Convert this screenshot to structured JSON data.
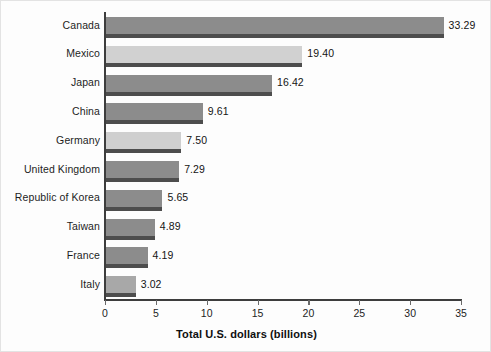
{
  "chart_data": {
    "type": "bar",
    "orientation": "horizontal",
    "title": "",
    "xlabel": "Total U.S. dollars (billions)",
    "ylabel": "",
    "xlim": [
      0,
      35
    ],
    "xticks": [
      "0",
      "5",
      "10",
      "15",
      "20",
      "25",
      "30",
      "35"
    ],
    "xtick_values": [
      0,
      5,
      10,
      15,
      20,
      25,
      30,
      35
    ],
    "grid": false,
    "legend": null,
    "categories": [
      "Canada",
      "Mexico",
      "Japan",
      "China",
      "Germany",
      "United Kingdom",
      "Republic of Korea",
      "Taiwan",
      "France",
      "Italy"
    ],
    "values": [
      33.29,
      19.4,
      16.42,
      9.61,
      7.5,
      7.29,
      5.65,
      4.89,
      4.19,
      3.02
    ],
    "data_labels": [
      "33.29",
      "19.40",
      "16.42",
      "9.61",
      "7.50",
      "7.29",
      "5.65",
      "4.89",
      "4.19",
      "3.02"
    ],
    "bar_colors": [
      "#8c8c8c",
      "#d1d1d1",
      "#8c8c8c",
      "#8c8c8c",
      "#cfcfcf",
      "#8c8c8c",
      "#8c8c8c",
      "#8c8c8c",
      "#8c8c8c",
      "#a8a8a8"
    ],
    "shadow_color": "#4d4d4d",
    "axis_color": "#3d3d3d",
    "background_color": "#fdfdfd"
  }
}
